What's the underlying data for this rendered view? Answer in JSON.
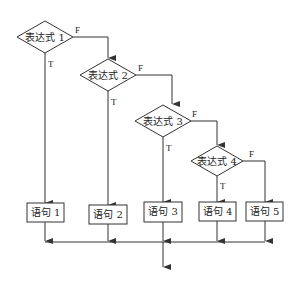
{
  "diagram": {
    "type": "flowchart",
    "decisions": [
      {
        "label": "表达式 1",
        "true_label": "T",
        "false_label": "F"
      },
      {
        "label": "表达式 2",
        "true_label": "T",
        "false_label": "F"
      },
      {
        "label": "表达式 3",
        "true_label": "T",
        "false_label": "F"
      },
      {
        "label": "表达式 4",
        "true_label": "T",
        "false_label": "F"
      }
    ],
    "statements": [
      {
        "label": "语句 1"
      },
      {
        "label": "语句 2"
      },
      {
        "label": "语句 3"
      },
      {
        "label": "语句 4"
      },
      {
        "label": "语句 5"
      }
    ],
    "colors": {
      "stroke": "#333333",
      "background": "#ffffff",
      "text": "#222222"
    }
  }
}
